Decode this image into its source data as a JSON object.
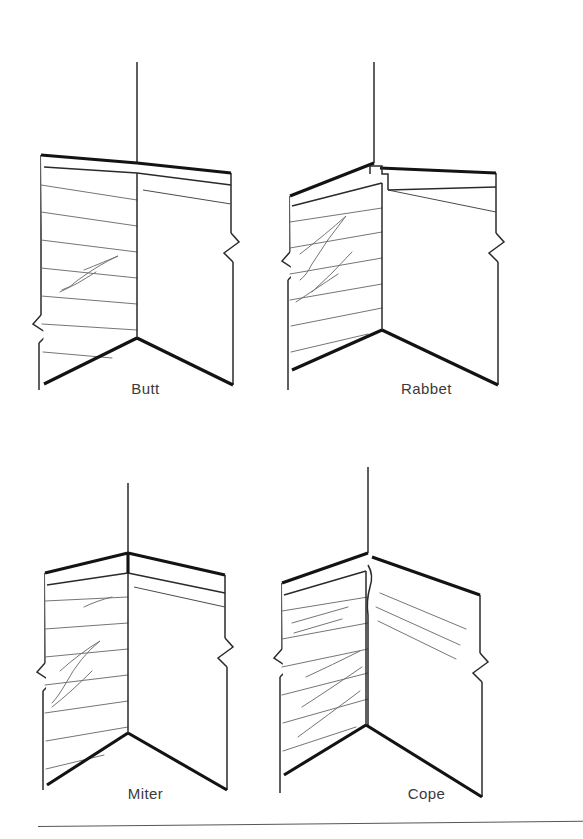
{
  "page": {
    "background_color": "#ffffff",
    "width": 583,
    "height": 839,
    "line_color": "#131313",
    "grain_color": "#6e6e6e",
    "label_color": "#3a3a3a"
  },
  "figure": {
    "type": "technical-line-illustration",
    "projection": "isometric",
    "layout": "2x2 grid",
    "joint_count": 4
  },
  "joints": [
    {
      "id": "butt",
      "label": "Butt",
      "position": "top-left",
      "corner_detail": "square end of left board butts flat against face of right board",
      "grain_face": "left",
      "break_symbols": 2
    },
    {
      "id": "rabbet",
      "label": "Rabbet",
      "position": "top-right",
      "corner_detail": "stepped rectangular notch cut in the board end forms an interlocking shoulder",
      "grain_face": "left",
      "break_symbols": 2
    },
    {
      "id": "miter",
      "label": "Miter",
      "position": "bottom-left",
      "corner_detail": "both boards cut at 45 degrees meeting in a clean diagonal seam at the apex",
      "grain_face": "left",
      "break_symbols": 2
    },
    {
      "id": "cope",
      "label": "Cope",
      "position": "bottom-right",
      "corner_detail": "end of one board scribed to a curved profile matching the contour of the other",
      "grain_face": "left",
      "break_symbols": 2
    }
  ],
  "rule": {
    "present": true,
    "orientation": "horizontal",
    "position": "bottom of page"
  }
}
